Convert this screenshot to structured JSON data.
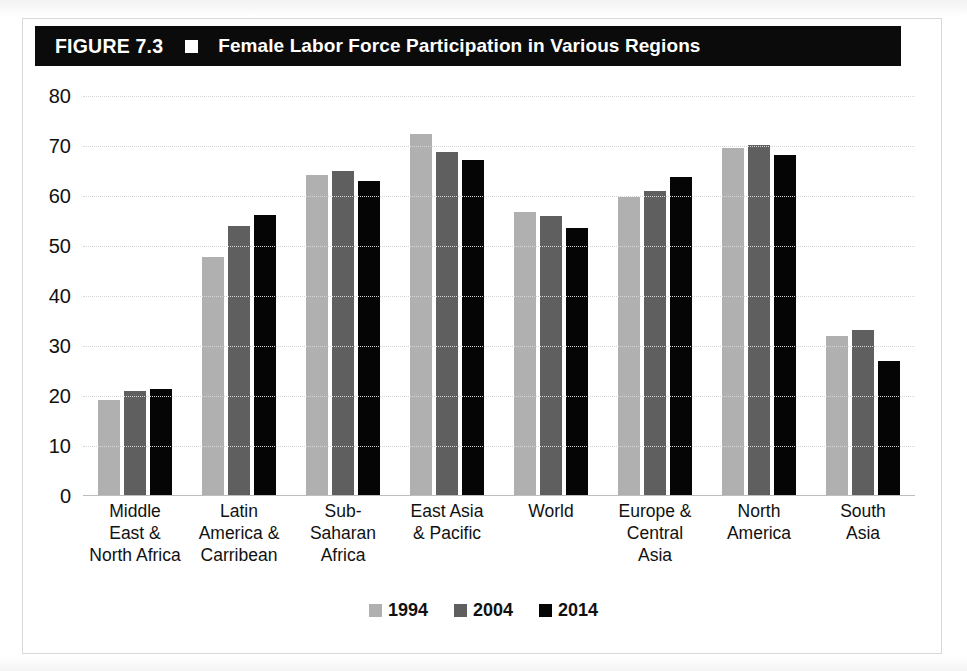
{
  "figure": {
    "number": "FIGURE 7.3",
    "marker_icon": "white-square-icon",
    "title": "Female Labor Force Participation in Various Regions"
  },
  "chart_data": {
    "type": "bar",
    "title": "Female Labor Force Participation in Various Regions",
    "xlabel": "",
    "ylabel": "",
    "ylim": [
      0,
      80
    ],
    "yticks": [
      80,
      70,
      60,
      50,
      40,
      30,
      20,
      10,
      0
    ],
    "grid": true,
    "legend_position": "bottom-center",
    "categories": [
      "Middle East & North Africa",
      "Latin America & Carribean",
      "Sub-Saharan Africa",
      "East Asia & Pacific",
      "World",
      "Europe & Central Asia",
      "North America",
      "South Asia"
    ],
    "category_lines": [
      [
        "Middle",
        "East &",
        "North Africa"
      ],
      [
        "Latin",
        "America &",
        "Carribean"
      ],
      [
        "Sub-",
        "Saharan",
        "Africa"
      ],
      [
        "East Asia",
        "& Pacific"
      ],
      [
        "World"
      ],
      [
        "Europe &",
        "Central",
        "Asia"
      ],
      [
        "North",
        "America"
      ],
      [
        "South",
        "Asia"
      ]
    ],
    "series": [
      {
        "name": "1994",
        "color": "#b0b0b0",
        "values": [
          19.3,
          47.8,
          64.3,
          72.5,
          56.8,
          59.8,
          69.7,
          32.0
        ]
      },
      {
        "name": "2004",
        "color": "#5f5f5f",
        "values": [
          21.0,
          54.0,
          65.0,
          68.8,
          56.0,
          61.0,
          70.2,
          33.3
        ]
      },
      {
        "name": "2014",
        "color": "#050505",
        "values": [
          21.5,
          56.2,
          63.0,
          67.2,
          53.7,
          63.9,
          68.3,
          27.0
        ]
      }
    ]
  }
}
